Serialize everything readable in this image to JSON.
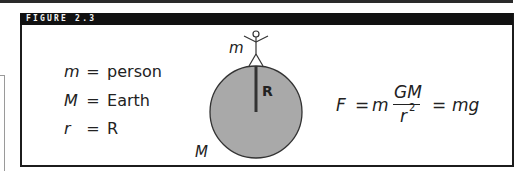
{
  "figure": {
    "label": "FIGURE 2.3"
  },
  "legend": [
    {
      "symbol": "m",
      "equals": "=",
      "meaning": "person"
    },
    {
      "symbol": "M",
      "equals": "=",
      "meaning": "Earth"
    },
    {
      "symbol": "r",
      "equals": "=",
      "meaning": "R"
    }
  ],
  "diagram": {
    "person_label": "m",
    "earth_label": "M",
    "radius_label": "R",
    "earth_fill": "#a9a9a9",
    "stroke": "#333333"
  },
  "formula": {
    "lhs": "F",
    "eq1": "=",
    "m": "m",
    "numerator": "GM",
    "denominator": "r",
    "exponent": "2",
    "eq2": "=",
    "rhs": "mg"
  }
}
